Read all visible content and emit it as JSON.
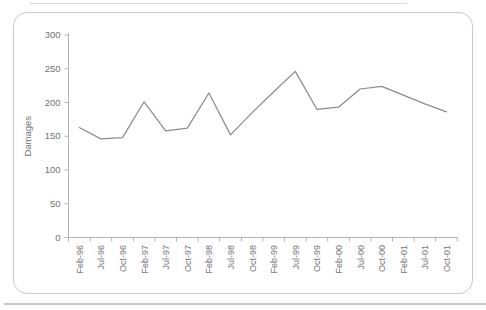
{
  "chart_data": {
    "type": "line",
    "title": "",
    "xlabel": "",
    "ylabel": "Damages",
    "categories": [
      "Feb-96",
      "Jul-96",
      "Oct-96",
      "Feb-97",
      "Jul-97",
      "Oct-97",
      "Feb-98",
      "Jul-98",
      "Oct-98",
      "Feb-99",
      "Jul-99",
      "Oct-99",
      "Feb-00",
      "Jul-00",
      "Oct-00",
      "Feb-01",
      "Jul-01",
      "Oct-01"
    ],
    "values": [
      163,
      146,
      148,
      201,
      158,
      162,
      214,
      152,
      185,
      216,
      246,
      190,
      193,
      220,
      224,
      211,
      198,
      186
    ],
    "ylim": [
      0,
      300
    ],
    "yticks": [
      0,
      50,
      100,
      150,
      200,
      250,
      300
    ],
    "grid": false,
    "legend_position": "none",
    "series_name": "Damages"
  },
  "colors": {
    "line": "#8c8c8c",
    "axis": "#b3b3b3",
    "tick_text": "#737373",
    "card_border": "#c9c9c9",
    "background": "#ffffff"
  }
}
